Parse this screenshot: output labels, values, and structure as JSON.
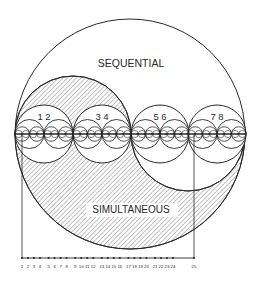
{
  "diagram": {
    "labels": {
      "sequential": "SEQUENTIAL",
      "simultaneous": "SIMULTANEOUS"
    },
    "pair_labels": [
      "1 2",
      "3 4",
      "5 6",
      "7 8"
    ],
    "ruler_ticks": [
      "1",
      "2",
      "3",
      "4",
      "5",
      "6",
      "7",
      "8",
      "9",
      "10",
      "11",
      "12",
      "13",
      "14",
      "15",
      "16",
      "17",
      "18",
      "19",
      "20",
      "21",
      "22",
      "23",
      "24",
      "25"
    ],
    "colors": {
      "stroke": "#2a2a2a",
      "hatch": "#555555",
      "background": "#ffffff"
    }
  }
}
